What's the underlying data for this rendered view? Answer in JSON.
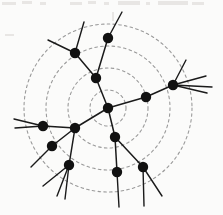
{
  "figure": {
    "background_color": "#fbfbfa",
    "node_color": "#111111",
    "edge_color": "#1a1a1a",
    "circle_color": "#9a9a9a",
    "node_radius": 5.2,
    "edge_width": 1.5,
    "stub_width": 1.4
  },
  "chart_data": {
    "type": "scatter",
    "xlabel": "",
    "ylabel": "",
    "xlim": [
      0,
      223
    ],
    "ylim": [
      0,
      215
    ],
    "grid": false,
    "legend": "none",
    "center": {
      "x": 108,
      "y": 108
    },
    "rings": [
      {
        "label": "ring-1",
        "radius": 18
      },
      {
        "label": "ring-2",
        "radius": 40
      },
      {
        "label": "ring-3",
        "radius": 62
      },
      {
        "label": "ring-4",
        "radius": 84
      }
    ],
    "nodes": [
      {
        "id": "n0",
        "label": "root",
        "x": 108,
        "y": 108
      },
      {
        "id": "n1",
        "label": "upper-branch",
        "x": 96,
        "y": 78
      },
      {
        "id": "n2",
        "label": "upper-left",
        "x": 75,
        "y": 53
      },
      {
        "id": "n3",
        "label": "top",
        "x": 108,
        "y": 38
      },
      {
        "id": "n4",
        "label": "right-inner",
        "x": 146,
        "y": 97
      },
      {
        "id": "n5",
        "label": "right-outer",
        "x": 173,
        "y": 85
      },
      {
        "id": "n6",
        "label": "left-branch",
        "x": 75,
        "y": 128
      },
      {
        "id": "n7",
        "label": "far-left",
        "x": 43,
        "y": 126
      },
      {
        "id": "n8",
        "label": "left-lower",
        "x": 52,
        "y": 146
      },
      {
        "id": "n9",
        "label": "lower-left",
        "x": 69,
        "y": 165
      },
      {
        "id": "n10",
        "label": "lower-mid",
        "x": 115,
        "y": 137
      },
      {
        "id": "n11",
        "label": "bottom-mid",
        "x": 117,
        "y": 172
      },
      {
        "id": "n12",
        "label": "bottom-right",
        "x": 143,
        "y": 167
      }
    ],
    "edges": [
      {
        "source": "n0",
        "target": "n1"
      },
      {
        "source": "n1",
        "target": "n2"
      },
      {
        "source": "n1",
        "target": "n3"
      },
      {
        "source": "n0",
        "target": "n4"
      },
      {
        "source": "n4",
        "target": "n5"
      },
      {
        "source": "n0",
        "target": "n6"
      },
      {
        "source": "n6",
        "target": "n7"
      },
      {
        "source": "n6",
        "target": "n8"
      },
      {
        "source": "n6",
        "target": "n9"
      },
      {
        "source": "n0",
        "target": "n10"
      },
      {
        "source": "n10",
        "target": "n11"
      },
      {
        "source": "n10",
        "target": "n12"
      }
    ],
    "stubs": [
      {
        "node": "n2",
        "x1": 75,
        "y1": 53,
        "x2": 84,
        "y2": 22
      },
      {
        "node": "n2",
        "x1": 75,
        "y1": 53,
        "x2": 48,
        "y2": 40
      },
      {
        "node": "n3",
        "x1": 108,
        "y1": 38,
        "x2": 122,
        "y2": 12
      },
      {
        "node": "n5",
        "x1": 173,
        "y1": 85,
        "x2": 186,
        "y2": 60
      },
      {
        "node": "n5",
        "x1": 173,
        "y1": 85,
        "x2": 206,
        "y2": 76
      },
      {
        "node": "n5",
        "x1": 173,
        "y1": 85,
        "x2": 212,
        "y2": 87
      },
      {
        "node": "n5",
        "x1": 173,
        "y1": 85,
        "x2": 207,
        "y2": 93
      },
      {
        "node": "n7",
        "x1": 43,
        "y1": 126,
        "x2": 14,
        "y2": 119
      },
      {
        "node": "n7",
        "x1": 43,
        "y1": 126,
        "x2": 15,
        "y2": 128
      },
      {
        "node": "n8",
        "x1": 52,
        "y1": 146,
        "x2": 31,
        "y2": 167
      },
      {
        "node": "n9",
        "x1": 69,
        "y1": 165,
        "x2": 43,
        "y2": 186
      },
      {
        "node": "n9",
        "x1": 69,
        "y1": 165,
        "x2": 57,
        "y2": 196
      },
      {
        "node": "n9",
        "x1": 69,
        "y1": 165,
        "x2": 65,
        "y2": 199
      },
      {
        "node": "n11",
        "x1": 117,
        "y1": 172,
        "x2": 119,
        "y2": 207
      },
      {
        "node": "n12",
        "x1": 143,
        "y1": 167,
        "x2": 144,
        "y2": 206
      },
      {
        "node": "n12",
        "x1": 143,
        "y1": 167,
        "x2": 162,
        "y2": 196
      }
    ],
    "artifacts": [
      {
        "x": 2,
        "y": 2,
        "w": 14,
        "h": 3
      },
      {
        "x": 22,
        "y": 1,
        "w": 10,
        "h": 3
      },
      {
        "x": 40,
        "y": 2,
        "w": 6,
        "h": 3
      },
      {
        "x": 70,
        "y": 2,
        "w": 12,
        "h": 3
      },
      {
        "x": 88,
        "y": 1,
        "w": 8,
        "h": 3
      },
      {
        "x": 104,
        "y": 2,
        "w": 5,
        "h": 3
      },
      {
        "x": 118,
        "y": 1,
        "w": 22,
        "h": 4
      },
      {
        "x": 146,
        "y": 2,
        "w": 4,
        "h": 3
      },
      {
        "x": 158,
        "y": 1,
        "w": 30,
        "h": 4
      },
      {
        "x": 192,
        "y": 2,
        "w": 12,
        "h": 3
      },
      {
        "x": 5,
        "y": 34,
        "w": 9,
        "h": 2
      },
      {
        "x": 112,
        "y": 12,
        "w": 2,
        "h": 9
      }
    ]
  }
}
